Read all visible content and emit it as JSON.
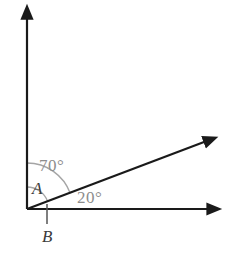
{
  "figure": {
    "background_color": "#ffffff",
    "line_color": "#1a1a1a",
    "arc_color": "#9a9a9a",
    "label_color_angles": "#8d8d8d",
    "label_color_points": "#3b3b3b",
    "vertex": {
      "x": 27,
      "y": 209
    },
    "rays": [
      {
        "name": "vertical-ray",
        "from": {
          "x": 27,
          "y": 209
        },
        "to": {
          "x": 27,
          "y": 12
        },
        "arrowhead": true,
        "direction_deg": 90
      },
      {
        "name": "horizontal-ray",
        "from": {
          "x": 27,
          "y": 209
        },
        "to": {
          "x": 215,
          "y": 209
        },
        "arrowhead": true,
        "direction_deg": 0
      },
      {
        "name": "diagonal-ray",
        "from": {
          "x": 27,
          "y": 209
        },
        "to": {
          "x": 212,
          "y": 139
        },
        "arrowhead": true,
        "direction_deg": 20
      }
    ],
    "tick": {
      "name": "tick-mark-B",
      "x": 47,
      "y_top": 204,
      "y_bottom": 224
    },
    "arcs": [
      {
        "name": "arc-70-degrees",
        "radius": 46,
        "start_deg": 20,
        "end_deg": 90,
        "measures": "70"
      },
      {
        "name": "arc-angle-A",
        "radius": 22,
        "start_deg": 20,
        "end_deg": 90,
        "measures": "A"
      }
    ],
    "labels": {
      "angle_top": "70°",
      "angle_bottom": "20°",
      "point_a": "A",
      "point_b": "B"
    }
  }
}
